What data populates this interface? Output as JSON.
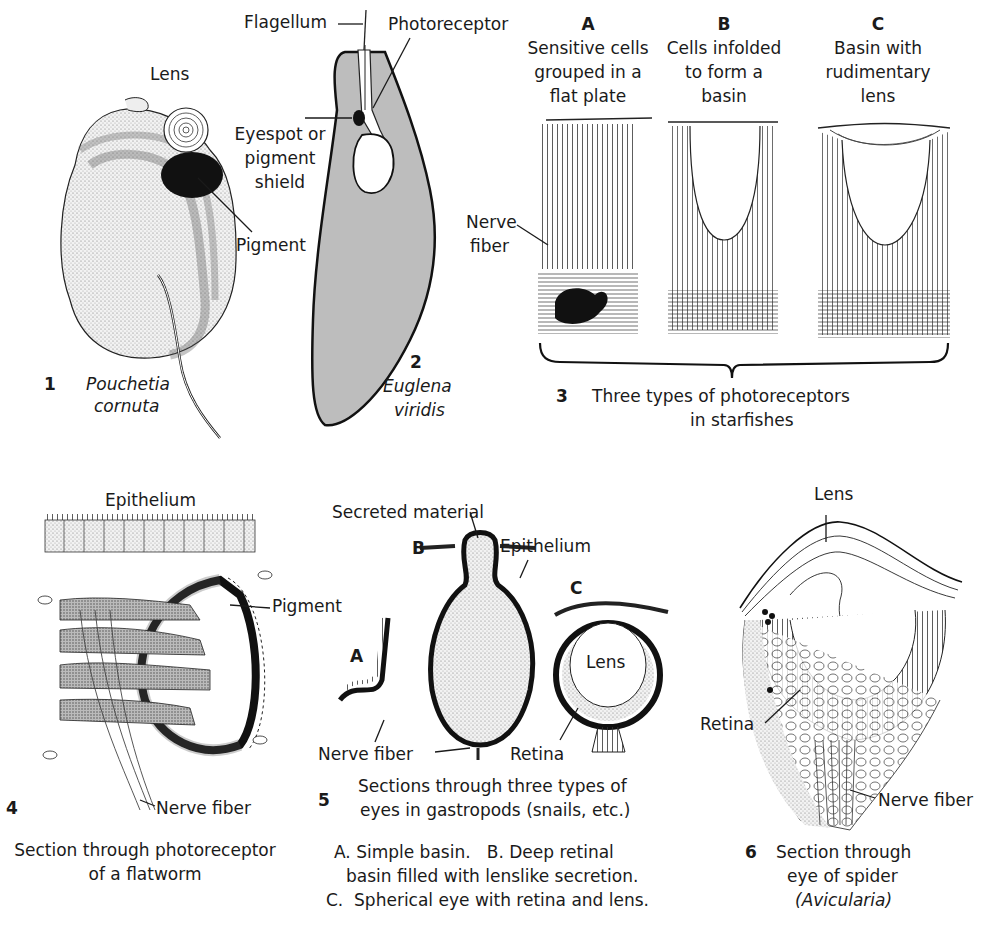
{
  "figure": {
    "colors": {
      "ink": "#1a1a1a",
      "euglena_fill": "#bdbdbd",
      "stipple": "#d9d9d9",
      "pigment": "#111111",
      "background": "#ffffff"
    },
    "panels": [
      {
        "number": "1",
        "species": [
          "Pouchetia",
          "cornuta"
        ],
        "labels": {
          "lens": "Lens",
          "pigment": "Pigment"
        }
      },
      {
        "number": "2",
        "species": [
          "Euglena",
          "viridis"
        ],
        "labels": {
          "flagellum": "Flagellum",
          "photoreceptor": "Photoreceptor",
          "eyespot": [
            "Eyespot or",
            "pigment",
            "shield"
          ]
        }
      },
      {
        "number": "3",
        "caption": [
          "Three types of photoreceptors",
          "in starfishes"
        ],
        "nerve_fiber": [
          "Nerve",
          "fiber"
        ],
        "subpanels": [
          {
            "letter": "A",
            "text": [
              "Sensitive cells",
              "grouped in a",
              "flat plate"
            ]
          },
          {
            "letter": "B",
            "text": [
              "Cells infolded",
              "to form a",
              "basin"
            ]
          },
          {
            "letter": "C",
            "text": [
              "Basin with",
              "rudimentary",
              "lens"
            ]
          }
        ]
      },
      {
        "number": "4",
        "labels": {
          "epithelium": "Epithelium",
          "pigment": "Pigment",
          "nerve_fiber": "Nerve fiber"
        },
        "caption": [
          "Section through photoreceptor",
          "of a flatworm"
        ]
      },
      {
        "number": "5",
        "labels": {
          "secreted_material": "Secreted material",
          "epithelium": "Epithelium",
          "lens": "Lens",
          "nerve_fiber": "Nerve fiber",
          "retina": "Retina",
          "a": "A",
          "b": "B",
          "c": "C"
        },
        "caption": [
          "Sections through three types of",
          "eyes in gastropods (snails, etc.)"
        ],
        "legend": [
          "A. Simple basin.   B. Deep retinal",
          "basin filled with lenslike secretion.",
          "C.  Spherical eye with retina and lens."
        ]
      },
      {
        "number": "6",
        "labels": {
          "lens": "Lens",
          "retina": "Retina",
          "nerve_fiber": "Nerve fiber"
        },
        "caption": [
          "Section through",
          "eye of spider",
          "(Avicularia)"
        ]
      }
    ]
  }
}
